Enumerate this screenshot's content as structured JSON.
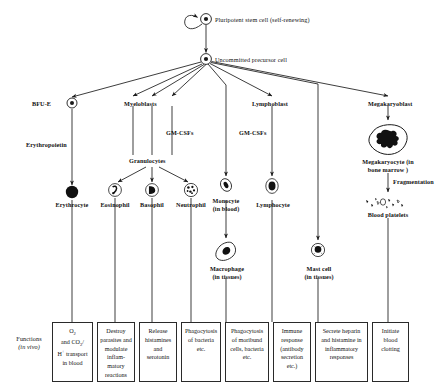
{
  "diagram": {
    "title_nodes": {
      "pluripotent": "Pluripotent stem cell (self-renewing)",
      "uncommitted": "Uncommitted precursor cell"
    },
    "lineages": {
      "bfue": "BFU-E",
      "myeloblasts": "Myeloblasts",
      "lymphoblast": "Lymphoblast",
      "megakaryoblast": "Megakaryoblast"
    },
    "factors": {
      "erythropoietin": "Erythropoietin",
      "gm_csf_left": "GM-CSFs",
      "gm_csf_right": "GM-CSFs",
      "fragmentation": "Fragmentation"
    },
    "intermediate": {
      "granulocytes": "Granulocytes",
      "megakaryocyte_l1": "Megakaryocyte (in",
      "megakaryocyte_l2": "bone marrow )",
      "blood_platelets": "Blood platelets"
    },
    "cells": [
      {
        "name": "Erythrocyte",
        "line2": ""
      },
      {
        "name": "Eosinophil",
        "line2": ""
      },
      {
        "name": "Basophil",
        "line2": ""
      },
      {
        "name": "Neutrophil",
        "line2": ""
      },
      {
        "name": "Monocyte",
        "line2": "(in blood)"
      },
      {
        "name": "Lymphocyte",
        "line2": ""
      },
      {
        "name": "Macrophage",
        "line2": "(in tissues)"
      },
      {
        "name": "Mast cell",
        "line2": "(in tissues)"
      }
    ],
    "functions_label_l1": "Functions",
    "functions_label_l2": "(in vivo)",
    "functions": [
      "O2 and CO2/ H+ transport in blood",
      "Destroy parasites and modulate inflam- matory reactions",
      "Release histamines and serotonin",
      "Phagocytosis of bacteria etc.",
      "Phagocytosis of moribund cells, bacteria etc.",
      "Immune response (antibody secretion etc.)",
      "Secrete heparin and histamine in inflammatory responses",
      "Initiate blood clotting"
    ],
    "colors": {
      "ink": "#1a1a1a",
      "paper": "#ffffff"
    }
  }
}
